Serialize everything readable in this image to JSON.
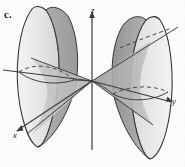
{
  "figure": {
    "panel_label": "c.",
    "caption": "Hyperboloid of two sheets with asymptotic cone, opening along the x-axis",
    "surface_type": "hyperboloid-of-two-sheets",
    "background_color": "#fdfdfc",
    "axes": [
      {
        "name": "z",
        "label": "z",
        "direction": "vertical-up",
        "arrow": true
      },
      {
        "name": "y",
        "label": "y",
        "direction": "right",
        "arrow": true
      },
      {
        "name": "x",
        "label": "x",
        "direction": "lower-left",
        "arrow": true
      }
    ],
    "colors": {
      "outline": "#2b2b2b",
      "axis": "#3a3a3a",
      "shade_light": "#ebebe9",
      "shade_mid": "#c9c9c7",
      "shade_dark": "#a9a9a7",
      "shade_darkest": "#8f8f8d",
      "dashed_hidden": "#3a3a3a",
      "label": "#1b1b1b"
    },
    "sheets": [
      {
        "name": "left-sheet",
        "side": "negative-x",
        "vertex_near_origin": true
      },
      {
        "name": "right-sheet",
        "side": "positive-x",
        "vertex_near_origin": true
      }
    ],
    "cone": {
      "name": "asymptotic-cone",
      "apex": "origin",
      "visible_generators": 4
    },
    "hidden_edges": {
      "style": "dashed",
      "count": 2,
      "description": "rear halves of the rim ellipses"
    }
  }
}
